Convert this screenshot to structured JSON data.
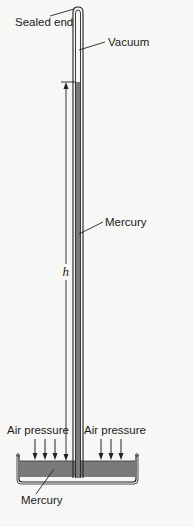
{
  "figure": {
    "type": "mercury barometer diagram",
    "labels": {
      "sealed_end": "Sealed end",
      "vacuum": "Vacuum",
      "mercury_column": "Mercury",
      "height": "h",
      "air_pressure_left": "Air pressure",
      "air_pressure_right": "Air pressure",
      "mercury_dish": "Mercury"
    },
    "colors": {
      "mercury": "#7a7a7a",
      "outline": "#222222",
      "background": "#f7f7f5"
    }
  }
}
